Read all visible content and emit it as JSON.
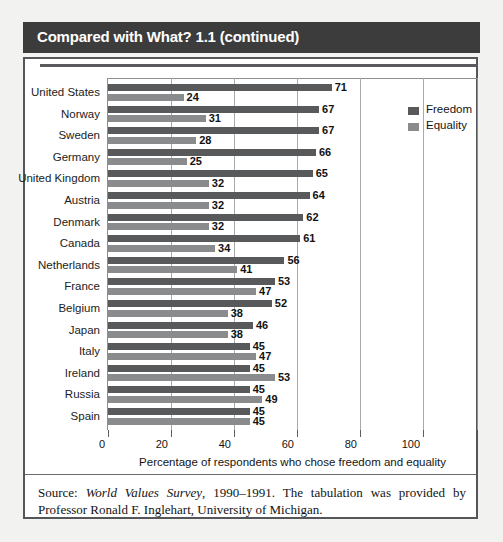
{
  "box": {
    "title": "Compared with What? 1.1 (continued)"
  },
  "legend": {
    "items": [
      {
        "label": "Freedom",
        "color": "#58595b"
      },
      {
        "label": "Equality",
        "color": "#8a8b8d"
      }
    ]
  },
  "source": {
    "prefix": "Source: ",
    "italic": "World Values Survey",
    "rest": ", 1990–1991. The tabulation was provided by Professor Ronald F. Inglehart, University of Michigan."
  },
  "chart_data": {
    "type": "bar",
    "orientation": "horizontal",
    "title": "",
    "xlabel": "Percentage of respondents who chose freedom and equality",
    "ylabel": "",
    "xlim": [
      0,
      100
    ],
    "xticks": [
      0,
      20,
      40,
      60,
      80,
      100
    ],
    "grid": true,
    "legend_position": "right",
    "categories": [
      "United States",
      "Norway",
      "Sweden",
      "Germany",
      "United Kingdom",
      "Austria",
      "Denmark",
      "Canada",
      "Netherlands",
      "France",
      "Belgium",
      "Japan",
      "Italy",
      "Ireland",
      "Russia",
      "Spain"
    ],
    "series": [
      {
        "name": "Freedom",
        "color": "#58595b",
        "values": [
          71,
          67,
          67,
          66,
          65,
          64,
          62,
          61,
          56,
          53,
          52,
          46,
          45,
          45,
          45,
          45
        ]
      },
      {
        "name": "Equality",
        "color": "#8a8b8d",
        "values": [
          24,
          31,
          28,
          25,
          32,
          32,
          32,
          34,
          41,
          47,
          38,
          38,
          47,
          53,
          49,
          45
        ]
      }
    ]
  }
}
